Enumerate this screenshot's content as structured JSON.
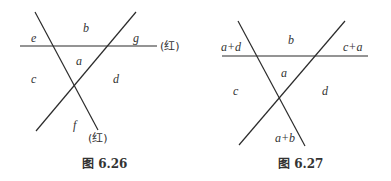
{
  "figures": [
    {
      "caption": "图 6.26",
      "regions": {
        "top_left": "e",
        "top": "b",
        "top_right": "g",
        "center": "a",
        "left": "c",
        "right": "d",
        "bottom": "f"
      },
      "annotations": {
        "horizontal_line": "(红)",
        "descending_line": "(红)"
      }
    },
    {
      "caption": "图 6.27",
      "regions": {
        "top_left": "a+d",
        "top": "b",
        "top_right": "c+a",
        "center": "a",
        "left": "c",
        "right": "d",
        "bottom": "a+b"
      }
    }
  ],
  "colors": {
    "line": "#2b2b2b",
    "text": "#333333",
    "background": "#ffffff"
  }
}
